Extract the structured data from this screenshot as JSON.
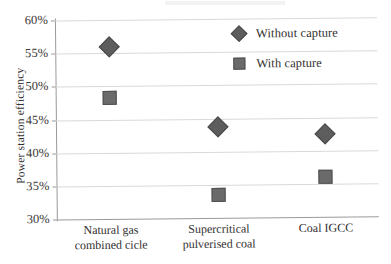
{
  "chart_data": {
    "type": "scatter",
    "title": "",
    "xlabel": "",
    "ylabel": "Power station efficiency",
    "categories": [
      "Natural gas\ncombined cicle",
      "Supercritical\npulverised coal",
      "Coal IGCC"
    ],
    "series": [
      {
        "name": "Without capture",
        "marker": "diamond",
        "color": "#5d5d5d",
        "values": [
          56.0,
          43.7,
          42.5
        ]
      },
      {
        "name": "With capture",
        "marker": "square",
        "color": "#6a6a6a",
        "values": [
          48.2,
          33.5,
          36.0
        ]
      }
    ],
    "ylim": [
      30,
      60
    ],
    "ytick_step": 5,
    "ytick_labels": [
      "60%",
      "55%",
      "50%",
      "45%",
      "40%",
      "35%",
      "30%"
    ],
    "ytick_values": [
      60,
      55,
      50,
      45,
      40,
      35,
      30
    ],
    "grid": "horizontal",
    "legend_position": "top-right"
  },
  "legend": {
    "items": [
      {
        "label": "Without capture",
        "marker": "diamond"
      },
      {
        "label": "With capture",
        "marker": "square"
      }
    ]
  }
}
